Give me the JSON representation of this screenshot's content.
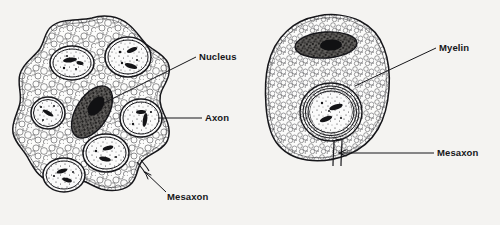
{
  "figure": {
    "background_color": "#f4f3f1",
    "ink_color": "#16161a"
  },
  "panels": [
    {
      "id": "left-panel",
      "name": "unmyelinated-schwann-cell",
      "structures": {
        "nucleus": "nucleus",
        "axons": "axons",
        "mesaxon": "mesaxon",
        "cytoplasm": "cytoplasm"
      },
      "axon_count": 6
    },
    {
      "id": "right-panel",
      "name": "myelinated-schwann-cell",
      "structures": {
        "nucleus": "nucleus",
        "myelin": "myelin",
        "mesaxon": "mesaxon",
        "cytoplasm": "cytoplasm"
      },
      "myelin_layers": 6
    }
  ],
  "labels": [
    {
      "id": "nucleus",
      "text": "Nucleus",
      "panel": "left"
    },
    {
      "id": "axon",
      "text": "Axon",
      "panel": "left"
    },
    {
      "id": "mesaxon-left",
      "text": "Mesaxon",
      "panel": "left"
    },
    {
      "id": "myelin",
      "text": "Myelin",
      "panel": "right"
    },
    {
      "id": "mesaxon-right",
      "text": "Mesaxon",
      "panel": "right"
    }
  ]
}
